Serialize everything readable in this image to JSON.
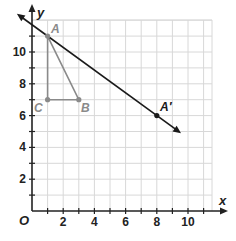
{
  "graph": {
    "x_axis_label": "x",
    "y_axis_label": "y",
    "origin_label": "O",
    "x_ticks": [
      "2",
      "4",
      "6",
      "8",
      "10"
    ],
    "y_ticks": [
      "2",
      "4",
      "6",
      "8",
      "10"
    ],
    "x_range": [
      0,
      11
    ],
    "y_range": [
      0,
      12
    ],
    "grid": true
  },
  "points": {
    "A": {
      "label": "A",
      "x": 1,
      "y": 11
    },
    "B": {
      "label": "B",
      "x": 3,
      "y": 7
    },
    "C": {
      "label": "C",
      "x": 1,
      "y": 7
    },
    "A_prime": {
      "label": "A′",
      "x": 8,
      "y": 6
    }
  },
  "line": {
    "label": "line through A and A′",
    "direction": "downward arrow"
  },
  "colors": {
    "grid": "#d8d8d8",
    "axis": "#222222",
    "triangle": "#8a8a8a",
    "line": "#1a1a1a",
    "triangle_label": "#8a8a8a"
  }
}
